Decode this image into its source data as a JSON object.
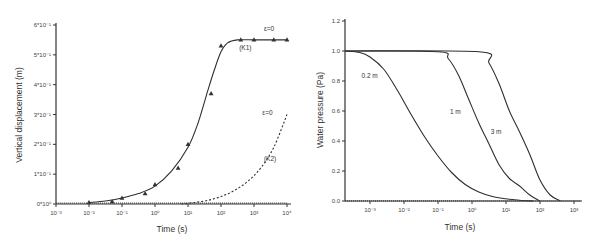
{
  "chart_data": [
    {
      "type": "line",
      "title": "",
      "xlabel": "Time (s)",
      "ylabel": "Vertical displacement (m)",
      "xscale": "log",
      "x_tick_labels": [
        "10⁻³",
        "10⁻²",
        "10⁻¹",
        "10⁰",
        "10¹",
        "10²",
        "10³",
        "10⁴"
      ],
      "y_tick_labels": [
        "0*10⁰",
        "1*10⁻¹",
        "2*10⁻¹",
        "3*10⁻¹",
        "4*10⁻¹",
        "5*10⁻¹",
        "6*10⁻¹"
      ],
      "ylim": [
        0,
        0.6
      ],
      "grid": false,
      "legend": "none",
      "annotations": [
        {
          "text": "ε=0",
          "x_decade": 6.3,
          "y": 0.58
        },
        {
          "text": "(K1)",
          "x_decade": 5.55,
          "y": 0.515
        },
        {
          "text": "ε=0",
          "x_decade": 6.25,
          "y": 0.3
        },
        {
          "text": "(K2)",
          "x_decade": 6.3,
          "y": 0.145
        }
      ],
      "series": [
        {
          "name": "K1 (computed)",
          "style": "solid",
          "x_decade": [
            1,
            1.5,
            2,
            2.5,
            3,
            3.5,
            4,
            4.3,
            4.6,
            4.8,
            5,
            5.2,
            5.5,
            6,
            6.5,
            7
          ],
          "y": [
            0.005,
            0.01,
            0.02,
            0.035,
            0.06,
            0.11,
            0.19,
            0.27,
            0.38,
            0.45,
            0.51,
            0.54,
            0.55,
            0.55,
            0.55,
            0.55
          ]
        },
        {
          "name": "K1 (measured)",
          "style": "triangle-markers",
          "x_decade": [
            1,
            1.7,
            2,
            2.7,
            3,
            3.7,
            4,
            4.7,
            5,
            5.6,
            6,
            6.6,
            7
          ],
          "y": [
            0.005,
            0.008,
            0.02,
            0.035,
            0.065,
            0.12,
            0.2,
            0.37,
            0.53,
            0.55,
            0.55,
            0.55,
            0.55
          ]
        },
        {
          "name": "K2 (computed)",
          "style": "dashed",
          "x_decade": [
            3.8,
            4.2,
            4.6,
            5,
            5.4,
            5.8,
            6.2,
            6.6,
            7
          ],
          "y": [
            0.0,
            0.005,
            0.012,
            0.025,
            0.045,
            0.075,
            0.12,
            0.19,
            0.3
          ]
        },
        {
          "name": "baseline",
          "style": "dotted",
          "x_decade": [
            0,
            7
          ],
          "y": [
            0.003,
            0.003
          ]
        }
      ]
    },
    {
      "type": "line",
      "title": "",
      "xlabel": "Time (s)",
      "ylabel": "Water pressure (Pa)",
      "xscale": "log",
      "x_tick_labels": [
        "10⁻³",
        "10⁻²",
        "10⁻¹",
        "10⁰",
        "10¹",
        "10²",
        "10³"
      ],
      "y_tick_labels": [
        "0.0",
        "0.2",
        "0.4",
        "0.6",
        "0.8",
        "1.0",
        "1.2"
      ],
      "ylim": [
        0,
        1.2
      ],
      "grid": false,
      "legend": "none",
      "annotations": [
        {
          "text": "0.2 m",
          "x_decade": -0.25,
          "y": 0.82
        },
        {
          "text": "1 m",
          "x_decade": 2.35,
          "y": 0.58
        },
        {
          "text": "3 m",
          "x_decade": 3.55,
          "y": 0.45
        }
      ],
      "series": [
        {
          "name": "0.2 m",
          "style": "solid",
          "x_decade": [
            -0.73,
            -0.3,
            0,
            0.4,
            0.8,
            1.2,
            1.6,
            2.0,
            2.4,
            2.8,
            3.2,
            3.6,
            4.0,
            4.4,
            4.8
          ],
          "y": [
            1.0,
            0.99,
            0.96,
            0.88,
            0.74,
            0.58,
            0.43,
            0.3,
            0.19,
            0.11,
            0.06,
            0.03,
            0.015,
            0.005,
            0.0
          ]
        },
        {
          "name": "1 m",
          "style": "solid",
          "x_decade": [
            -0.73,
            2.0,
            2.3,
            2.6,
            2.9,
            3.2,
            3.5,
            3.8,
            4.1,
            4.4,
            4.7,
            5.0
          ],
          "y": [
            1.0,
            0.995,
            0.95,
            0.84,
            0.68,
            0.52,
            0.38,
            0.24,
            0.15,
            0.1,
            0.04,
            0.0
          ]
        },
        {
          "name": "3 m",
          "style": "solid",
          "x_decade": [
            -0.73,
            3.2,
            3.5,
            3.8,
            4.1,
            4.4,
            4.7,
            5.0,
            5.3,
            5.6
          ],
          "y": [
            1.0,
            0.995,
            0.92,
            0.78,
            0.6,
            0.46,
            0.31,
            0.14,
            0.04,
            0.0
          ]
        },
        {
          "name": "baseline",
          "style": "dotted",
          "x_decade": [
            -0.73,
            6.2
          ],
          "y": [
            0.0,
            0.0
          ]
        }
      ]
    }
  ]
}
